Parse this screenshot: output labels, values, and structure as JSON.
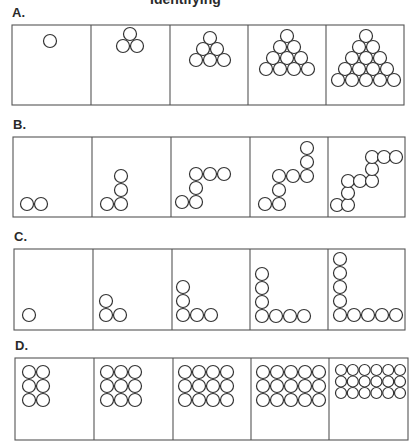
{
  "title_cut": "Identifying",
  "rows": [
    {
      "id": "A",
      "label": "A.",
      "box": {
        "x": 12,
        "y": 25,
        "w": 392,
        "h": 80
      },
      "dividers": [
        91,
        170,
        248,
        326
      ],
      "panels": [
        {
          "r": 6.5,
          "circles": [
            [
              50,
              41
            ]
          ]
        },
        {
          "r": 6.5,
          "circles": [
            [
              130,
              34
            ],
            [
              123,
              46
            ],
            [
              137,
              46
            ]
          ]
        },
        {
          "r": 6.5,
          "circles": [
            [
              210,
              38
            ],
            [
              203,
              49
            ],
            [
              217,
              49
            ],
            [
              196,
              60
            ],
            [
              210,
              60
            ],
            [
              224,
              60
            ]
          ]
        },
        {
          "r": 6.5,
          "circles": [
            [
              287,
              36
            ],
            [
              280,
              47
            ],
            [
              294,
              47
            ],
            [
              273,
              58
            ],
            [
              287,
              58
            ],
            [
              301,
              58
            ],
            [
              266,
              69
            ],
            [
              280,
              69
            ],
            [
              294,
              69
            ],
            [
              308,
              69
            ]
          ]
        },
        {
          "r": 6.5,
          "circles": [
            [
              366,
              36
            ],
            [
              359,
              47
            ],
            [
              373,
              47
            ],
            [
              352,
              58
            ],
            [
              366,
              58
            ],
            [
              380,
              58
            ],
            [
              345,
              69
            ],
            [
              359,
              69
            ],
            [
              373,
              69
            ],
            [
              387,
              69
            ],
            [
              338,
              80
            ],
            [
              352,
              80
            ],
            [
              366,
              80
            ],
            [
              380,
              80
            ],
            [
              394,
              80
            ]
          ]
        }
      ]
    },
    {
      "id": "B",
      "label": "B.",
      "box": {
        "x": 13,
        "y": 137,
        "w": 392,
        "h": 80
      },
      "dividers": [
        92,
        171,
        250,
        328
      ],
      "panels": [
        {
          "r": 6.5,
          "circles": [
            [
              27,
              204
            ],
            [
              41,
              204
            ]
          ]
        },
        {
          "r": 6.5,
          "circles": [
            [
              107,
              204
            ],
            [
              121,
              204
            ],
            [
              121,
              190
            ],
            [
              121,
              176
            ]
          ]
        },
        {
          "r": 6.5,
          "circles": [
            [
              182,
              202
            ],
            [
              196,
              202
            ],
            [
              196,
              188
            ],
            [
              196,
              174
            ],
            [
              210,
              174
            ],
            [
              224,
              174
            ]
          ]
        },
        {
          "r": 6.5,
          "circles": [
            [
              265,
              204
            ],
            [
              279,
              204
            ],
            [
              279,
              190
            ],
            [
              279,
              176
            ],
            [
              293,
              176
            ],
            [
              307,
              176
            ],
            [
              307,
              162
            ],
            [
              307,
              148
            ]
          ]
        },
        {
          "r": 6.5,
          "circles": [
            [
              337,
              205
            ],
            [
              348,
              205
            ],
            [
              348,
              193
            ],
            [
              348,
              181
            ],
            [
              360,
              181
            ],
            [
              372,
              181
            ],
            [
              372,
              169
            ],
            [
              372,
              157
            ],
            [
              384,
              157
            ],
            [
              396,
              157
            ]
          ]
        }
      ]
    },
    {
      "id": "C",
      "label": "C.",
      "box": {
        "x": 14,
        "y": 249,
        "w": 391,
        "h": 81
      },
      "dividers": [
        93,
        172,
        250,
        328
      ],
      "panels": [
        {
          "r": 6.5,
          "circles": [
            [
              29,
              315
            ]
          ]
        },
        {
          "r": 6.5,
          "circles": [
            [
              106,
              301
            ],
            [
              106,
              315
            ],
            [
              120,
              315
            ]
          ]
        },
        {
          "r": 6.5,
          "circles": [
            [
              183,
              287
            ],
            [
              183,
              301
            ],
            [
              183,
              315
            ],
            [
              197,
              315
            ],
            [
              211,
              315
            ]
          ]
        },
        {
          "r": 6.5,
          "circles": [
            [
              262,
              274
            ],
            [
              262,
              288
            ],
            [
              262,
              302
            ],
            [
              262,
              316
            ],
            [
              276,
              316
            ],
            [
              290,
              316
            ],
            [
              304,
              316
            ]
          ]
        },
        {
          "r": 6.5,
          "circles": [
            [
              340,
              259
            ],
            [
              340,
              273
            ],
            [
              340,
              287
            ],
            [
              340,
              301
            ],
            [
              340,
              315
            ],
            [
              354,
              315
            ],
            [
              368,
              315
            ],
            [
              382,
              315
            ],
            [
              396,
              315
            ]
          ]
        }
      ]
    },
    {
      "id": "D",
      "label": "D.",
      "box": {
        "x": 15,
        "y": 358,
        "w": 393,
        "h": 82
      },
      "dividers": [
        94,
        173,
        251,
        329
      ],
      "panels": [
        {
          "r": 6.5,
          "grid": {
            "x0": 29,
            "y0": 372,
            "cols": 2,
            "rows": 3,
            "dx": 14,
            "dy": 14
          }
        },
        {
          "r": 6.5,
          "grid": {
            "x0": 107,
            "y0": 372,
            "cols": 3,
            "rows": 3,
            "dx": 14,
            "dy": 14
          }
        },
        {
          "r": 6.5,
          "grid": {
            "x0": 185,
            "y0": 372,
            "cols": 4,
            "rows": 3,
            "dx": 14,
            "dy": 14
          }
        },
        {
          "r": 6.5,
          "grid": {
            "x0": 263,
            "y0": 372,
            "cols": 5,
            "rows": 3,
            "dx": 14,
            "dy": 14
          }
        },
        {
          "r": 5.5,
          "grid": {
            "x0": 341,
            "y0": 370,
            "cols": 6,
            "rows": 3,
            "dx": 11.8,
            "dy": 11.5
          }
        }
      ]
    }
  ]
}
